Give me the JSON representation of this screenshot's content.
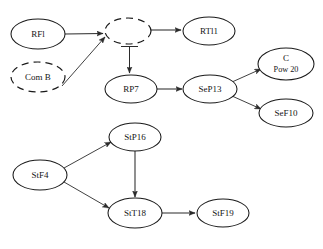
{
  "diagram": {
    "title": "",
    "background_color": "#ffffff",
    "stroke_color": "#1a1a1a",
    "nodes": [
      {
        "id": "RFl",
        "label": "RFl",
        "label2": "",
        "cx": 38,
        "cy": 34,
        "rx": 27,
        "ry": 15,
        "style": "solid"
      },
      {
        "id": "ComB",
        "label": "Com B",
        "label2": "",
        "cx": 38,
        "cy": 77,
        "rx": 27,
        "ry": 15,
        "style": "dashed"
      },
      {
        "id": "Hub",
        "label": "",
        "label2": "",
        "cx": 128,
        "cy": 31,
        "rx": 23,
        "ry": 13,
        "style": "dashed"
      },
      {
        "id": "RTl1",
        "label": "RTl1",
        "label2": "",
        "cx": 209,
        "cy": 31,
        "rx": 26,
        "ry": 14,
        "style": "solid"
      },
      {
        "id": "RP7",
        "label": "RP7",
        "label2": "",
        "cx": 131,
        "cy": 89,
        "rx": 26,
        "ry": 14,
        "style": "solid"
      },
      {
        "id": "SeP13",
        "label": "SeP13",
        "label2": "",
        "cx": 210,
        "cy": 89,
        "rx": 27,
        "ry": 14,
        "style": "solid"
      },
      {
        "id": "CPow20",
        "label": "C",
        "label2": "Pow 20",
        "cx": 286,
        "cy": 64,
        "rx": 28,
        "ry": 16,
        "style": "solid"
      },
      {
        "id": "SeF10",
        "label": "SeF10",
        "label2": "",
        "cx": 286,
        "cy": 113,
        "rx": 27,
        "ry": 14,
        "style": "solid"
      },
      {
        "id": "StP16",
        "label": "StP16",
        "label2": "",
        "cx": 135,
        "cy": 137,
        "rx": 26,
        "ry": 14,
        "style": "solid"
      },
      {
        "id": "StF4",
        "label": "StF4",
        "label2": "",
        "cx": 40,
        "cy": 175,
        "rx": 27,
        "ry": 15,
        "style": "solid"
      },
      {
        "id": "StT18",
        "label": "StT18",
        "label2": "",
        "cx": 135,
        "cy": 213,
        "rx": 27,
        "ry": 15,
        "style": "solid"
      },
      {
        "id": "StF19",
        "label": "StF19",
        "label2": "",
        "cx": 223,
        "cy": 213,
        "rx": 26,
        "ry": 14,
        "style": "solid"
      }
    ],
    "edges": [
      {
        "id": "RFl-Hub",
        "from": "RFl",
        "to": "Hub",
        "head": "arrow"
      },
      {
        "id": "ComB-Hub",
        "from": "ComB",
        "to": "Hub",
        "head": "arrow"
      },
      {
        "id": "Hub-RTl1",
        "from": "Hub",
        "to": "RTl1",
        "head": "arrow"
      },
      {
        "id": "Hub-RP7",
        "from": "Hub",
        "to": "RP7",
        "head": "arrow-bar"
      },
      {
        "id": "RP7-SeP13",
        "from": "RP7",
        "to": "SeP13",
        "head": "arrow"
      },
      {
        "id": "SeP13-CPow20",
        "from": "SeP13",
        "to": "CPow20",
        "head": "arrow"
      },
      {
        "id": "SeP13-SeF10",
        "from": "SeP13",
        "to": "SeF10",
        "head": "arrow"
      },
      {
        "id": "StF4-StP16",
        "from": "StF4",
        "to": "StP16",
        "head": "arrow"
      },
      {
        "id": "StF4-StT18",
        "from": "StF4",
        "to": "StT18",
        "head": "arrow"
      },
      {
        "id": "StP16-StT18",
        "from": "StP16",
        "to": "StT18",
        "head": "arrow"
      },
      {
        "id": "StT18-StF19",
        "from": "StT18",
        "to": "StF19",
        "head": "arrow"
      }
    ]
  }
}
